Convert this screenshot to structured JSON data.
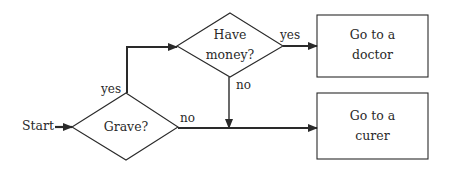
{
  "diagram": {
    "type": "flowchart",
    "start": {
      "label": "Start"
    },
    "nodes": [
      {
        "id": "grave",
        "shape": "diamond",
        "label": "Grave?"
      },
      {
        "id": "money",
        "shape": "diamond",
        "line1": "Have",
        "line2": "money?"
      },
      {
        "id": "doctor",
        "shape": "rectangle",
        "line1": "Go to a",
        "line2": "doctor"
      },
      {
        "id": "curer",
        "shape": "rectangle",
        "line1": "Go to a",
        "line2": "curer"
      }
    ],
    "edges": [
      {
        "from": "start",
        "to": "grave",
        "label": ""
      },
      {
        "from": "grave",
        "to": "money",
        "label": "yes"
      },
      {
        "from": "grave",
        "to": "curer",
        "label": "no"
      },
      {
        "from": "money",
        "to": "doctor",
        "label": "yes"
      },
      {
        "from": "money",
        "to": "curer",
        "label": "no"
      }
    ],
    "colors": {
      "stroke": "#2a2a2a",
      "background": "#ffffff"
    }
  }
}
